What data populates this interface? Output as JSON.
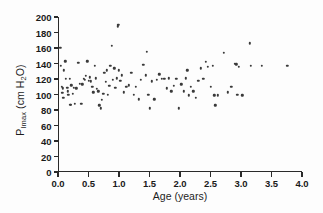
{
  "chart_data": {
    "type": "scatter",
    "title": "",
    "xlabel": "Age (years)",
    "ylabel": "PImax (cm H2O)",
    "ylabel_main": "P",
    "ylabel_sub": "Imax",
    "ylabel_unit": " (cm H",
    "ylabel_unit_sub": "2",
    "ylabel_unit_end": "O)",
    "xlim": [
      0.0,
      4.0
    ],
    "ylim": [
      0,
      200
    ],
    "xticks": [
      0.0,
      0.5,
      1.0,
      1.5,
      2.0,
      2.5,
      3.0,
      3.5,
      4.0
    ],
    "xticklabels": [
      "0.0",
      "0.5",
      "1.0",
      "1.5",
      "2.0",
      "2.5",
      "3.0",
      "3.5",
      "4.0"
    ],
    "yticks": [
      0,
      20,
      40,
      60,
      80,
      100,
      120,
      140,
      160,
      180,
      200
    ],
    "yticklabels": [
      "0",
      "20",
      "40",
      "60",
      "80",
      "100",
      "120",
      "140",
      "160",
      "180",
      "200"
    ],
    "grid": false,
    "legend": false,
    "marker": "dot",
    "marker_color": "#3a3a3a",
    "n_points": 112,
    "x": [
      0.04,
      0.05,
      0.06,
      0.07,
      0.08,
      0.09,
      0.1,
      0.12,
      0.13,
      0.15,
      0.16,
      0.17,
      0.19,
      0.2,
      0.21,
      0.22,
      0.24,
      0.26,
      0.28,
      0.3,
      0.33,
      0.36,
      0.38,
      0.4,
      0.42,
      0.44,
      0.46,
      0.48,
      0.5,
      0.52,
      0.54,
      0.56,
      0.58,
      0.6,
      0.62,
      0.64,
      0.66,
      0.68,
      0.7,
      0.72,
      0.74,
      0.76,
      0.78,
      0.8,
      0.82,
      0.84,
      0.86,
      0.88,
      0.9,
      0.92,
      0.94,
      0.96,
      0.98,
      0.99,
      1.0,
      1.02,
      1.05,
      1.08,
      1.12,
      1.16,
      1.2,
      1.24,
      1.28,
      1.32,
      1.36,
      1.4,
      1.44,
      1.46,
      1.48,
      1.5,
      1.54,
      1.58,
      1.62,
      1.66,
      1.7,
      1.74,
      1.78,
      1.82,
      1.86,
      1.9,
      1.94,
      1.98,
      2.02,
      2.06,
      2.1,
      2.12,
      2.14,
      2.18,
      2.22,
      2.26,
      2.3,
      2.34,
      2.38,
      2.42,
      2.46,
      2.5,
      2.54,
      2.56,
      2.58,
      2.62,
      2.72,
      2.78,
      2.84,
      2.9,
      2.92,
      2.94,
      2.96,
      3.02,
      3.14,
      3.16,
      3.34,
      3.76
    ],
    "y": [
      160,
      137,
      110,
      102,
      108,
      96,
      131,
      143,
      120,
      109,
      104,
      100,
      120,
      87,
      87,
      112,
      101,
      109,
      88,
      108,
      141,
      114,
      88,
      113,
      120,
      119,
      124,
      143,
      118,
      122,
      117,
      110,
      103,
      137,
      121,
      107,
      104,
      86,
      82,
      93,
      101,
      128,
      116,
      131,
      100,
      111,
      137,
      163,
      119,
      134,
      109,
      121,
      188,
      190,
      131,
      118,
      125,
      103,
      110,
      112,
      128,
      100,
      110,
      94,
      119,
      138,
      125,
      155,
      100,
      82,
      117,
      94,
      119,
      126,
      120,
      120,
      108,
      121,
      104,
      111,
      120,
      82,
      113,
      104,
      121,
      131,
      99,
      110,
      104,
      96,
      118,
      134,
      120,
      142,
      136,
      110,
      137,
      99,
      86,
      99,
      154,
      103,
      110,
      140,
      139,
      100,
      136,
      99,
      166,
      137,
      137,
      137
    ]
  }
}
